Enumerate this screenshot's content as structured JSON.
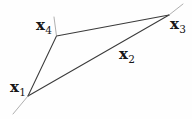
{
  "figure": {
    "kind": "geometric-diagram",
    "colors": {
      "background": "#fefefe",
      "edge": "#3a3a3a",
      "overshoot": "#949494",
      "label": "#161616"
    },
    "points": {
      "x1": {
        "x": 28,
        "y": 96
      },
      "x4": {
        "x": 56.5,
        "y": 36
      },
      "x3": {
        "x": 169,
        "y": 15
      }
    },
    "extensions": {
      "below_x1": {
        "x1": 28,
        "y1": 96,
        "x2": 13,
        "y2": 114
      },
      "above_x3": {
        "x1": 169,
        "y1": 15,
        "x2": 183,
        "y2": 4
      },
      "above_x4": {
        "x1": 56.5,
        "y1": 36,
        "x2": 54,
        "y2": 17
      }
    },
    "labels": {
      "x1": {
        "base": "x",
        "sub": "1",
        "x": 26,
        "y": 92
      },
      "x4": {
        "base": "x",
        "sub": "4",
        "x": 52,
        "y": 30
      },
      "x2": {
        "base": "x",
        "sub": "2",
        "x": 119,
        "y": 59
      },
      "x3": {
        "base": "x",
        "sub": "3",
        "x": 170,
        "y": 29
      }
    }
  }
}
